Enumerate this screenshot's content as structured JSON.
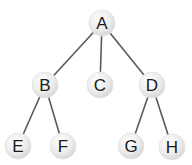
{
  "diagram": {
    "type": "tree",
    "colors": {
      "edge": "#5a5a5a",
      "node_fill_center": "#ffffff",
      "node_fill_edge": "#d9d9d9",
      "node_stroke": "#e2e2e2",
      "label": "#1a1a1a",
      "background": "#ffffff"
    },
    "nodes": [
      {
        "id": "A",
        "label": "A",
        "x": 102,
        "y": 23
      },
      {
        "id": "B",
        "label": "B",
        "x": 45,
        "y": 85
      },
      {
        "id": "C",
        "label": "C",
        "x": 100,
        "y": 85
      },
      {
        "id": "D",
        "label": "D",
        "x": 152,
        "y": 85
      },
      {
        "id": "E",
        "label": "E",
        "x": 18,
        "y": 146
      },
      {
        "id": "F",
        "label": "F",
        "x": 63,
        "y": 146
      },
      {
        "id": "G",
        "label": "G",
        "x": 131,
        "y": 146
      },
      {
        "id": "H",
        "label": "H",
        "x": 172,
        "y": 147
      }
    ],
    "edges": [
      {
        "from": "A",
        "to": "B"
      },
      {
        "from": "A",
        "to": "C"
      },
      {
        "from": "A",
        "to": "D"
      },
      {
        "from": "B",
        "to": "E"
      },
      {
        "from": "B",
        "to": "F"
      },
      {
        "from": "D",
        "to": "G"
      },
      {
        "from": "D",
        "to": "H"
      }
    ],
    "node_radius": 13
  }
}
